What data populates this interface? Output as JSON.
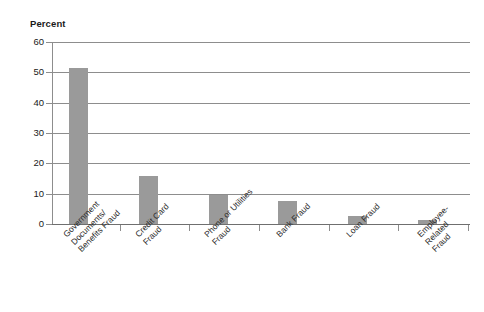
{
  "chart_data": {
    "type": "bar",
    "title": "",
    "subtitle": "",
    "xlabel": "",
    "ylabel": "Percent",
    "ylim": [
      0,
      60
    ],
    "ytick_values": [
      0,
      10,
      20,
      30,
      40,
      50,
      60
    ],
    "ytick_labels": [
      "0",
      "10",
      "20",
      "30",
      "40",
      "50",
      "60"
    ],
    "grid": true,
    "legend": null,
    "bar_color": "#9a9a9a",
    "categories": [
      "Government\nDocuments/\nBenefits Fraud",
      "Credit Card\nFraud",
      "Phone or Utilities\nFraud",
      "Bank Fraud",
      "Loan Fraud",
      "Employee-\nRelated\nFraud"
    ],
    "values": [
      51.5,
      15.8,
      9.5,
      7.5,
      2.5,
      1.2
    ]
  },
  "axes": {
    "y_title": "Percent",
    "y_ticks": [
      {
        "label": "60",
        "value": 60
      },
      {
        "label": "50",
        "value": 50
      },
      {
        "label": "40",
        "value": 40
      },
      {
        "label": "30",
        "value": 30
      },
      {
        "label": "20",
        "value": 20
      },
      {
        "label": "10",
        "value": 10
      },
      {
        "label": "0",
        "value": 0
      }
    ]
  },
  "bars": [
    {
      "label": "Government\nDocuments/\nBenefits Fraud",
      "value": 51.5
    },
    {
      "label": "Credit Card\nFraud",
      "value": 15.8
    },
    {
      "label": "Phone or Utilities\nFraud",
      "value": 9.5
    },
    {
      "label": "Bank Fraud",
      "value": 7.5
    },
    {
      "label": "Loan Fraud",
      "value": 2.5
    },
    {
      "label": "Employee-\nRelated\nFraud",
      "value": 1.2
    }
  ]
}
